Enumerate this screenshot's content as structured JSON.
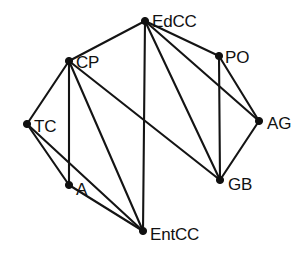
{
  "figure": {
    "background_color": "#ffffff",
    "edge_color": "#141414",
    "node_color": "#101010",
    "label_color": "#111111"
  },
  "chart_data": {
    "type": "diagram",
    "subtype": "node-link-graph",
    "title": "",
    "xlabel": "",
    "ylabel": "",
    "directed": false,
    "grid": false,
    "legend": null,
    "xlim": [
      0,
      308
    ],
    "ylim": [
      0,
      261
    ],
    "node_count": 8,
    "edge_count": 15,
    "nodes": [
      {
        "id": "EdCC",
        "label": "EdCC",
        "x": 145,
        "y": 21,
        "label_dx": 7,
        "label_dy": 2,
        "degree": 5
      },
      {
        "id": "CP",
        "label": "CP",
        "x": 69,
        "y": 61,
        "label_dx": 7,
        "label_dy": 3,
        "degree": 5
      },
      {
        "id": "PO",
        "label": "PO",
        "x": 219,
        "y": 56,
        "label_dx": 6,
        "label_dy": 3,
        "degree": 3
      },
      {
        "id": "TC",
        "label": "TC",
        "x": 27,
        "y": 124,
        "label_dx": 7,
        "label_dy": 4,
        "degree": 3
      },
      {
        "id": "AG",
        "label": "AG",
        "x": 259,
        "y": 121,
        "label_dx": 8,
        "label_dy": 4,
        "degree": 3
      },
      {
        "id": "A",
        "label": "A",
        "x": 69,
        "y": 185,
        "label_dx": 7,
        "label_dy": 6,
        "degree": 3
      },
      {
        "id": "GB",
        "label": "GB",
        "x": 220,
        "y": 180,
        "label_dx": 8,
        "label_dy": 6,
        "degree": 4
      },
      {
        "id": "EntCC",
        "label": "EntCC",
        "x": 143,
        "y": 231,
        "label_dx": 7,
        "label_dy": 5,
        "degree": 4
      }
    ],
    "edges": [
      {
        "source": "CP",
        "target": "EdCC"
      },
      {
        "source": "EdCC",
        "target": "PO"
      },
      {
        "source": "EdCC",
        "target": "AG"
      },
      {
        "source": "EdCC",
        "target": "GB"
      },
      {
        "source": "EdCC",
        "target": "EntCC"
      },
      {
        "source": "PO",
        "target": "AG"
      },
      {
        "source": "PO",
        "target": "GB"
      },
      {
        "source": "AG",
        "target": "GB"
      },
      {
        "source": "CP",
        "target": "TC"
      },
      {
        "source": "CP",
        "target": "A"
      },
      {
        "source": "CP",
        "target": "EntCC"
      },
      {
        "source": "CP",
        "target": "GB"
      },
      {
        "source": "TC",
        "target": "A"
      },
      {
        "source": "TC",
        "target": "EntCC"
      },
      {
        "source": "A",
        "target": "EntCC"
      }
    ]
  }
}
